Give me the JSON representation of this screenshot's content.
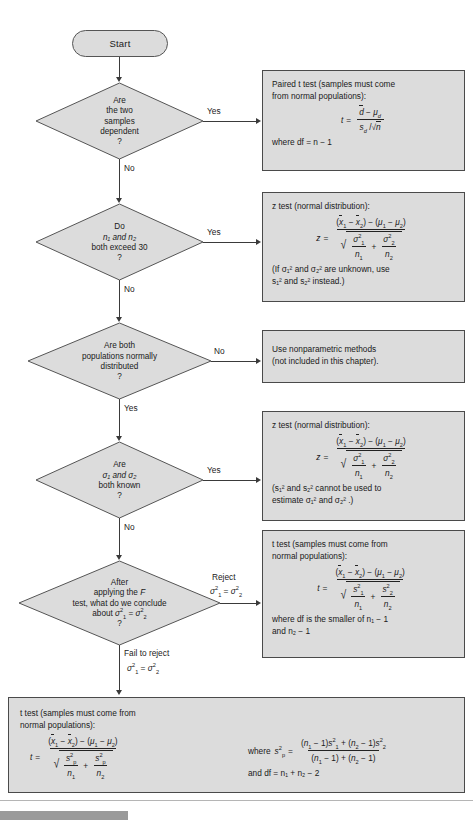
{
  "diagram": {
    "colors": {
      "node_fill": "#dcdcdc",
      "node_border": "#4a4a4a",
      "connector": "#3a3a3a",
      "page_background": "#ffffff",
      "footer_bar": "#9a9a9a"
    }
  },
  "start": {
    "label": "Start"
  },
  "decisions": [
    {
      "id": "dependent",
      "lines": [
        "Are",
        "the two",
        "samples",
        "dependent"
      ],
      "question_mark": "?",
      "yes_label": "Yes",
      "no_label": "No"
    },
    {
      "id": "sample-size",
      "lines": [
        "Do",
        "n₁ and n₂",
        "both exceed 30"
      ],
      "question_mark": "?",
      "yes_label": "Yes",
      "no_label": "No"
    },
    {
      "id": "normality",
      "lines": [
        "Are both",
        "populations normally",
        "distributed"
      ],
      "question_mark": "?",
      "yes_label": "Yes",
      "no_label": "No"
    },
    {
      "id": "sigma-known",
      "lines": [
        "Are",
        "σ₁ and  σ₂",
        "both known"
      ],
      "question_mark": "?",
      "yes_label": "Yes",
      "no_label": "No"
    },
    {
      "id": "f-test",
      "lines": [
        "After",
        "applying the F",
        "test, what do we conclude",
        "about σ₁² = σ₂²"
      ],
      "question_mark": "?",
      "reject_label": "Reject",
      "reject_condition": "σ₁² = σ₂²",
      "fail_label": "Fail to reject",
      "fail_condition": "σ₁² = σ₂²"
    }
  ],
  "panels": {
    "paired_t": {
      "heading_line1": "Paired t test (samples must come",
      "heading_line2": "from normal populations):",
      "formula_lhs": "t",
      "formula_eq": "=",
      "numerator": "d − μₑ",
      "denominator": "sₑ /√n",
      "footer": "where df = n − 1"
    },
    "z_test_large": {
      "heading": "z test (normal distribution):",
      "formula_lhs": "z",
      "note_line1": "(If σ₁² and σ₂² are unknown, use",
      "note_line2": "s₁² and s₂² instead.)"
    },
    "nonparametric": {
      "line1": "Use nonparametric methods",
      "line2": "(not included in this chapter)."
    },
    "z_test_sigma": {
      "heading": "z test (normal distribution):",
      "formula_lhs": "z",
      "note_line1": "(s₁² and s₂² cannot be used to",
      "note_line2": "estimate σ₁² and σ₂² .)"
    },
    "t_test_unequal": {
      "heading_line1": "t test (samples must come from",
      "heading_line2": "normal populations):",
      "formula_lhs": "t",
      "footer_line1": "where df is the smaller of n₁ − 1",
      "footer_line2": "and n₂ − 1"
    },
    "t_test_pooled": {
      "heading_line1": "t test (samples must come from",
      "heading_line2": "normal populations):",
      "formula_lhs": "t",
      "where_label": "where",
      "and_df": "and df  =  n₁ + n₂ − 2",
      "pooled_numerator": "(n₁ − 1)s₁² + (n₂ − 1)s₂²",
      "pooled_denominator": "(n₁ − 1) + (n₂ − 1)"
    }
  },
  "math_tokens": {
    "xbar1": "x̅₁",
    "xbar2": "x̅₂",
    "mu1": "μ₁",
    "mu2": "μ₂",
    "minus": "−",
    "plus": "+",
    "equals": "=",
    "numerator_means": "(x̅₁ − x̅₂) − (μ₁ − μ₂)",
    "denom_sigma": "√(σ₁²/n₁ + σ₂²/n₂)",
    "denom_s": "√(s₁²/n₁ + s₂²/n₂)",
    "denom_sp": "√(sₚ²/n₁ + sₚ²/n₂)"
  }
}
